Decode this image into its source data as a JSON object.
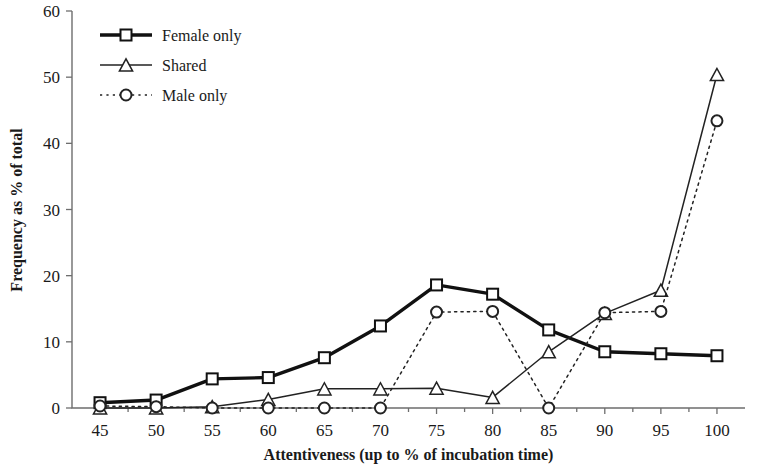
{
  "chart_data": {
    "type": "line",
    "title": "",
    "xlabel": "Attentiveness (up to % of incubation time)",
    "ylabel": "Frequency as % of total",
    "x": [
      45,
      50,
      55,
      60,
      65,
      70,
      75,
      80,
      85,
      90,
      95,
      100
    ],
    "xticklabels": [
      "45",
      "50",
      "55",
      "60",
      "65",
      "70",
      "75",
      "80",
      "85",
      "90",
      "95",
      "100"
    ],
    "yticklabels": [
      "0",
      "10",
      "20",
      "30",
      "40",
      "50",
      "60"
    ],
    "yticks": [
      0,
      10,
      20,
      30,
      40,
      50,
      60
    ],
    "xlim": [
      42.5,
      102.5
    ],
    "ylim": [
      0,
      60
    ],
    "grid": false,
    "legend_position": "top-left",
    "series": [
      {
        "name": "Female only",
        "marker": "square",
        "linestyle": "solid",
        "linewidth": "thick",
        "color": "#111111",
        "values": [
          0.8,
          1.2,
          4.4,
          4.6,
          7.6,
          12.4,
          18.6,
          17.2,
          11.8,
          8.5,
          8.2,
          7.9
        ]
      },
      {
        "name": "Shared",
        "marker": "triangle",
        "linestyle": "solid",
        "linewidth": "thin",
        "color": "#222222",
        "values": [
          0.0,
          0.0,
          0.2,
          1.3,
          2.9,
          2.9,
          3.0,
          1.6,
          8.5,
          14.3,
          17.8,
          50.4
        ]
      },
      {
        "name": "Male only",
        "marker": "circle",
        "linestyle": "dotted",
        "linewidth": "thin",
        "color": "#222222",
        "values": [
          0.3,
          0.2,
          0.0,
          0.0,
          0.0,
          0.0,
          14.5,
          14.6,
          0.0,
          14.4,
          14.6,
          43.4
        ]
      }
    ]
  },
  "legend": {
    "items": [
      {
        "label": "Female only"
      },
      {
        "label": "Shared"
      },
      {
        "label": "Male only"
      }
    ]
  }
}
